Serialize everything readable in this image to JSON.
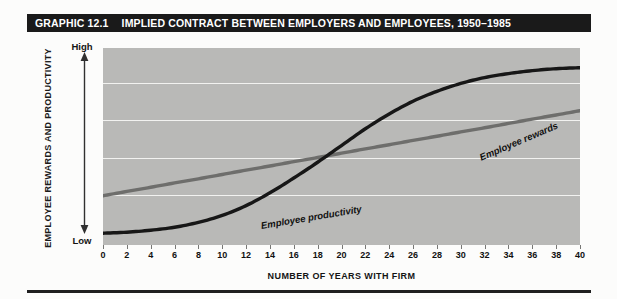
{
  "figure": {
    "number_label": "GRAPHIC 12.1",
    "title": "IMPLIED CONTRACT BETWEEN EMPLOYERS AND EMPLOYEES, 1950–1985"
  },
  "axes": {
    "y_title": "EMPLOYEE REWARDS AND PRODUCTIVITY",
    "y_high_label": "High",
    "y_low_label": "Low",
    "x_title": "NUMBER OF YEARS WITH FIRM"
  },
  "colors": {
    "title_bar": "#1a1a1a",
    "plot_background": "#b9b9b7",
    "gridline": "#f2f2f0",
    "rewards_line": "#171717",
    "productivity_line": "#6e6e6c",
    "page_background": "#fcfcfb"
  },
  "chart_data": {
    "type": "line",
    "title": "IMPLIED CONTRACT BETWEEN EMPLOYERS AND EMPLOYEES, 1950–1985",
    "xlabel": "NUMBER OF YEARS WITH FIRM",
    "ylabel": "EMPLOYEE REWARDS AND PRODUCTIVITY",
    "xlim": [
      0,
      40
    ],
    "ylim": [
      0,
      100
    ],
    "ytick_labels": [
      "Low",
      "High"
    ],
    "grid": true,
    "gridlines_horizontal": 4,
    "legend": "inline-labels",
    "xticks": [
      0,
      2,
      4,
      6,
      8,
      10,
      12,
      14,
      16,
      18,
      20,
      22,
      24,
      26,
      28,
      30,
      32,
      34,
      36,
      38,
      40
    ],
    "x": [
      0,
      2,
      4,
      6,
      8,
      10,
      12,
      14,
      16,
      18,
      20,
      22,
      24,
      26,
      28,
      30,
      32,
      34,
      36,
      38,
      40
    ],
    "series": [
      {
        "name": "Employee rewards",
        "color": "#171717",
        "width": 3.2,
        "values": [
          6,
          6.5,
          7.5,
          9,
          11.5,
          15,
          20,
          26.5,
          34,
          42,
          50.5,
          59,
          66.5,
          73,
          78,
          82,
          85,
          87,
          88.5,
          89.5,
          90
        ]
      },
      {
        "name": "Employee productivity",
        "color": "#6e6e6c",
        "width": 3.2,
        "values": [
          25,
          27.2,
          29.3,
          31.5,
          33.6,
          35.8,
          38,
          40.1,
          42.3,
          44.4,
          46.6,
          48.8,
          50.9,
          53.1,
          55.2,
          57.4,
          59.5,
          61.7,
          63.9,
          66,
          68.2
        ]
      }
    ],
    "annotations": [
      {
        "text": "Employee productivity",
        "at_x": 9,
        "at_y": 40
      },
      {
        "text": "Employee rewards",
        "at_x": 27,
        "at_y": 72
      }
    ],
    "crossover": {
      "x": 20,
      "y": 47
    }
  }
}
